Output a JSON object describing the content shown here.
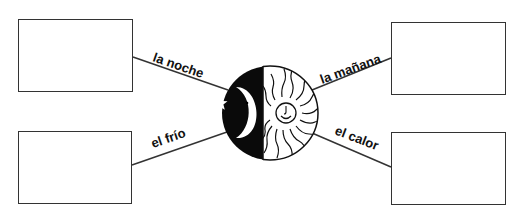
{
  "diagram": {
    "center_icon": "moon-sun-icon",
    "labels": {
      "top_left": "la noche",
      "bottom_left": "el frío",
      "top_right": "la mañana",
      "bottom_right": "el calor"
    },
    "boxes": {
      "top_left": "",
      "bottom_left": "",
      "top_right": "",
      "bottom_right": ""
    }
  }
}
